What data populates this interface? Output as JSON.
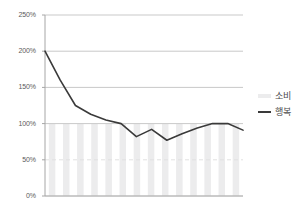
{
  "chart_data": {
    "type": "line",
    "title": "",
    "subtitle": "",
    "xlabel": "",
    "ylabel": "",
    "ylim": [
      0,
      250
    ],
    "ytick_labels": [
      "0%",
      "50%",
      "100%",
      "150%",
      "200%",
      "250%"
    ],
    "ytick_values": [
      0,
      50,
      100,
      150,
      200,
      250
    ],
    "grid": true,
    "grid_axis": "y",
    "legend_position": "right",
    "x": [
      1,
      2,
      3,
      4,
      5,
      6,
      7,
      8,
      9,
      10,
      11,
      12,
      13,
      14
    ],
    "series": [
      {
        "name": "소비",
        "type": "bar",
        "color": "#ececed",
        "values": [
          100,
          100,
          100,
          100,
          100,
          100,
          100,
          100,
          100,
          100,
          100,
          100,
          100,
          100
        ]
      },
      {
        "name": "행복",
        "type": "line",
        "color": "#3a3a3a",
        "values": [
          200,
          160,
          125,
          113,
          105,
          100,
          82,
          92,
          77,
          86,
          94,
          100,
          100,
          91
        ]
      }
    ]
  },
  "legend": {
    "items": [
      {
        "label": "소비",
        "swatch": "bar-swatch"
      },
      {
        "label": "행복",
        "swatch": "line-swatch"
      }
    ]
  },
  "axis": {
    "axis_color": "#a6a6a6",
    "grid_color": "#c9c9c9",
    "grid_color_faint": "#e2e2e2",
    "tick_text_color": "#5a5a5a"
  }
}
